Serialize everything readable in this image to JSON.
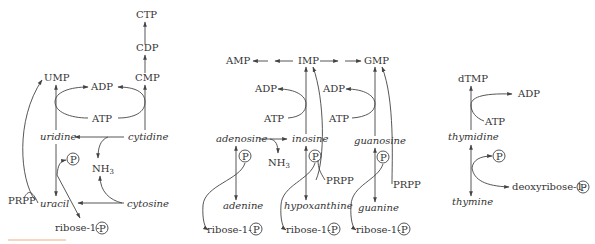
{
  "diagram": {
    "type": "nucleotide salvage pathways",
    "accent_color": "#f4c7a8",
    "pyrimidine": {
      "ctp": "CTP",
      "cdp": "CDP",
      "cmp": "CMP",
      "ump": "UMP",
      "adp": "ADP",
      "atp": "ATP",
      "uridine": "uridine",
      "cytidine": "cytidine",
      "p": "P",
      "nh3": "NH",
      "nh3_sub": "3",
      "prpp": "PRPP",
      "uracil": "uracil",
      "cytosine": "cytosine",
      "ribose": "ribose-1-",
      "ribose_p": "P"
    },
    "purine": {
      "amp": "AMP",
      "imp": "IMP",
      "gmp": "GMP",
      "adp1": "ADP",
      "atp1": "ATP",
      "adp2": "ADP",
      "atp2": "ATP",
      "adenosine": "adenosine",
      "inosine": "inosine",
      "guanosine": "guanosine",
      "p1": "P",
      "p2": "P",
      "p3": "P",
      "nh3": "NH",
      "nh3_sub": "3",
      "prpp1": "PRPP",
      "prpp2": "PRPP",
      "adenine": "adenine",
      "hypoxanthine": "hypoxanthine",
      "guanine": "guanine",
      "ribose1": "ribose-1-",
      "ribose1_p": "P",
      "ribose2": "ribose-1-",
      "ribose2_p": "P",
      "ribose3": "ribose-1-",
      "ribose3_p": "P"
    },
    "thymidine": {
      "dtmp": "dTMP",
      "adp": "ADP",
      "atp": "ATP",
      "thymidine": "thymidine",
      "p": "P",
      "thymine": "thymine",
      "deoxyribose": "deoxyribose-1-",
      "deoxyribose_p": "P"
    }
  }
}
